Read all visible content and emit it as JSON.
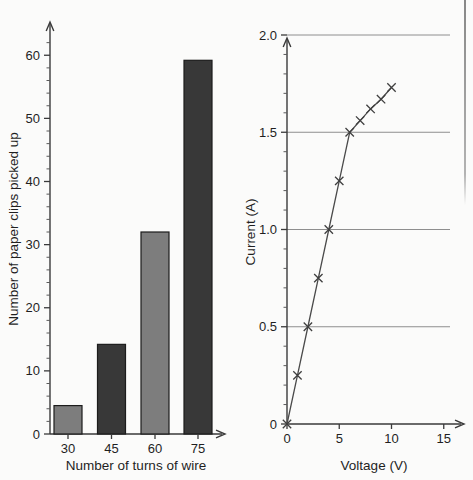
{
  "figure": {
    "background_color": "#fbfbfa",
    "ink_color": "#2b2b2b"
  },
  "chart_data": [
    {
      "id": "bar-chart",
      "type": "bar",
      "title": "",
      "xlabel": "Number of turns of wire",
      "ylabel": "Number of paper clips picked up",
      "categories": [
        "30",
        "45",
        "60",
        "75"
      ],
      "values": [
        4.5,
        14.2,
        32,
        59.2
      ],
      "bar_colors": [
        "#7d7d7d",
        "#383838",
        "#7d7d7d",
        "#383838"
      ],
      "ylim": [
        0,
        64
      ],
      "xtick_labels": [
        "30",
        "45",
        "60",
        "75"
      ],
      "ytick_labels": [
        "0",
        "10",
        "20",
        "30",
        "40",
        "50",
        "60"
      ],
      "ytick_values": [
        0,
        10,
        20,
        30,
        40,
        50,
        60
      ],
      "ytick_minor_step": 2,
      "grid": false,
      "legend": "none"
    },
    {
      "id": "line-chart",
      "type": "line",
      "title": "",
      "xlabel": "Voltage (V)",
      "ylabel": "Current (A)",
      "x": [
        0,
        1,
        2,
        3,
        4,
        5,
        6,
        7,
        8,
        9,
        10
      ],
      "y": [
        0,
        0.25,
        0.5,
        0.75,
        1.0,
        1.25,
        1.5,
        1.56,
        1.62,
        1.67,
        1.73
      ],
      "marker": "x",
      "line_color": "#4a4a4a",
      "xlim": [
        0,
        15.5
      ],
      "ylim": [
        0,
        2.1
      ],
      "xtick_labels": [
        "0",
        "5",
        "10",
        "15"
      ],
      "xtick_values": [
        0,
        5,
        10,
        15
      ],
      "ytick_labels": [
        "0",
        "0.5",
        "1.0",
        "1.5",
        "2.0"
      ],
      "ytick_values": [
        0,
        0.5,
        1.0,
        1.5,
        2.0
      ],
      "ytick_minor_step": 0.1,
      "grid": true,
      "grid_axis": "y",
      "grid_color": "#8e8e8e",
      "legend": "none"
    }
  ]
}
